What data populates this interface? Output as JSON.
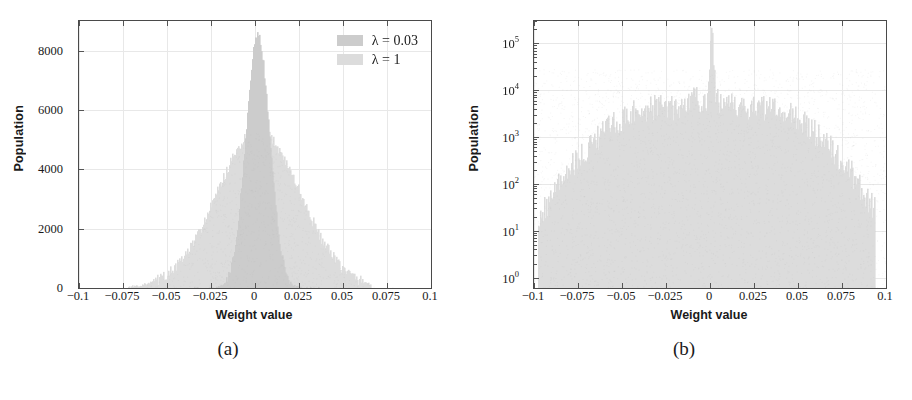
{
  "figure": {
    "panels": [
      {
        "id": "a",
        "caption": "(a)",
        "legend": [
          {
            "label": "λ = 0.03",
            "color": "#cccccc"
          },
          {
            "label": "λ = 1",
            "color": "#dcdcdc"
          }
        ]
      },
      {
        "id": "b",
        "caption": "(b)",
        "legend": []
      }
    ]
  },
  "chart_data": [
    {
      "type": "bar",
      "panel": "a",
      "title": "",
      "xlabel": "Weight value",
      "ylabel": "Population",
      "xlim": [
        -0.1,
        0.1
      ],
      "ylim": [
        0,
        9000
      ],
      "yscale": "linear",
      "grid": true,
      "legend_position": "top-right",
      "xticks": [
        -0.1,
        -0.075,
        -0.05,
        -0.025,
        0,
        0.025,
        0.05,
        0.075,
        0.1
      ],
      "xticklabels": [
        "−0.1",
        "−0.075",
        "−0.05",
        "−0.025",
        "0",
        "0.025",
        "0.05",
        "0.075",
        "0.1"
      ],
      "yticks": [
        0,
        2000,
        4000,
        6000,
        8000
      ],
      "yticklabels": [
        "0",
        "2000",
        "4000",
        "6000",
        "8000"
      ],
      "series": [
        {
          "name": "λ = 1",
          "color": "#dcdcdc",
          "kind": "gaussian",
          "mean": 0.002,
          "sigma": 0.0235,
          "peak": 5300,
          "xmin": -0.072,
          "xmax": 0.066,
          "noise": 190
        },
        {
          "name": "λ = 0.03",
          "color": "#cccccc",
          "kind": "gaussian",
          "mean": 0.0015,
          "sigma": 0.0068,
          "peak": 8500,
          "xmin": -0.035,
          "xmax": 0.038,
          "noise": 160
        }
      ]
    },
    {
      "type": "bar",
      "panel": "b",
      "title": "",
      "xlabel": "Weight value",
      "ylabel": "Population",
      "xlim": [
        -0.1,
        0.1
      ],
      "ylim": [
        0.6,
        300000
      ],
      "yscale": "log",
      "grid": true,
      "legend_position": "none",
      "xticks": [
        -0.1,
        -0.075,
        -0.05,
        -0.025,
        0,
        0.025,
        0.05,
        0.075,
        0.1
      ],
      "xticklabels": [
        "−0.1",
        "−0.075",
        "−0.05",
        "−0.025",
        "0",
        "0.025",
        "0.05",
        "0.075",
        "0.1"
      ],
      "yticks": [
        1,
        10,
        100,
        1000,
        10000,
        100000
      ],
      "yticklabels": [
        "10⁰",
        "10¹",
        "10²",
        "10³",
        "10⁴",
        "10⁵"
      ],
      "series": [
        {
          "name": "bimodal-broad",
          "color": "#dcdcdc",
          "kind": "bimodal-log",
          "lobe_centers": [
            -0.028,
            0.027
          ],
          "lobe_peak": 4200,
          "lobe_sigma": 0.021,
          "inner_centers": [
            -0.0075,
            0.0075
          ],
          "inner_peak": 2600,
          "inner_sigma": 0.0045,
          "central_spike_center": 0.001,
          "central_spike_peak": 150000,
          "central_spike_sigma": 0.0007,
          "xmin": -0.098,
          "xmax": 0.094,
          "noise": 0.28
        }
      ]
    }
  ]
}
